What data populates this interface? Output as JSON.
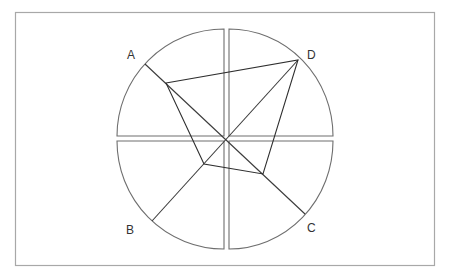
{
  "diagram": {
    "type": "quadrant-sector-kite",
    "labels": {
      "a": "A",
      "b": "B",
      "c": "C",
      "d": "D"
    },
    "colors": {
      "frame": "#a8a8a8",
      "sector_stroke": "#6e6e6e",
      "line": "#2e2e2e",
      "label": "#333333"
    }
  }
}
